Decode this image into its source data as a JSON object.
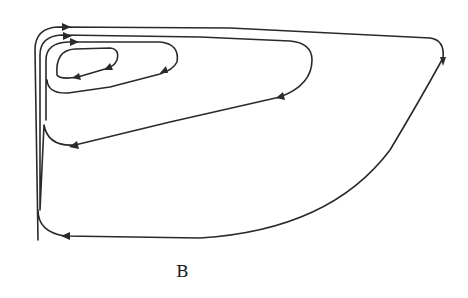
{
  "figure": {
    "label": "B",
    "stroke_color": "#2a2a2a",
    "background": "#ffffff"
  },
  "trajectory": {
    "loops": [
      {
        "name": "outer-loop",
        "arrows": 3
      },
      {
        "name": "second-loop",
        "arrows": 2
      },
      {
        "name": "third-loop",
        "arrows": 2
      },
      {
        "name": "inner-loop",
        "arrows": 2
      }
    ]
  }
}
